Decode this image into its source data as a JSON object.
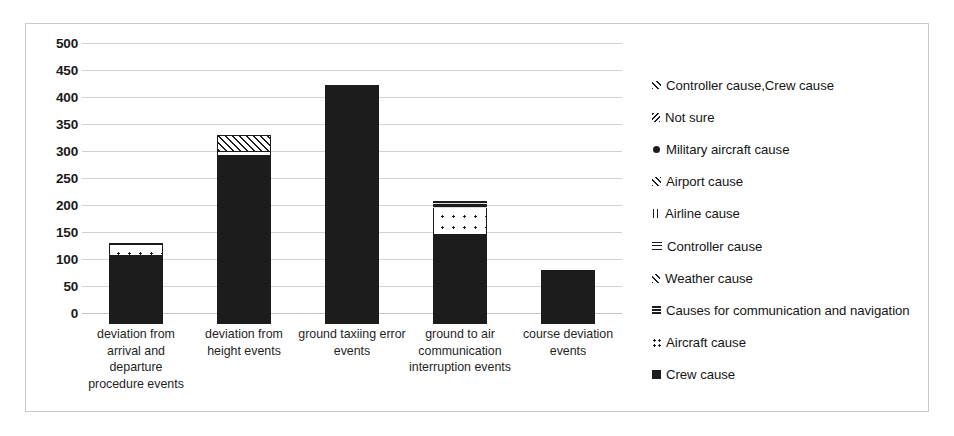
{
  "chart_data": {
    "type": "bar",
    "title": "",
    "xlabel": "",
    "ylabel": "",
    "ylim": [
      0,
      500
    ],
    "ytick_step": 50,
    "grid": true,
    "legend_position": "right",
    "stacked": true,
    "categories": [
      "deviation from arrival and departure procedure events",
      "deviation from height events",
      "ground taxiing error events",
      "ground to air communication interruption events",
      "course deviation events"
    ],
    "ytick_labels": [
      "500",
      "450",
      "400",
      "350",
      "300",
      "250",
      "200",
      "150",
      "100",
      "50",
      "0"
    ],
    "ytick_values": [
      500,
      450,
      400,
      350,
      300,
      250,
      200,
      150,
      100,
      50,
      0
    ],
    "series": [
      {
        "name": "Crew cause",
        "pattern": "solid-black",
        "values": [
          128,
          313,
          438,
          167,
          100
        ]
      },
      {
        "name": "Aircraft  cause",
        "pattern": "dotted",
        "values": [
          18,
          6,
          0,
          48,
          0
        ]
      },
      {
        "name": "Causes for communication and navigation",
        "pattern": "horizontal-lines-dark",
        "values": [
          0,
          0,
          0,
          13,
          0
        ]
      },
      {
        "name": "Weather  cause",
        "pattern": "fine-diagonal",
        "values": [
          0,
          0,
          0,
          0,
          0
        ]
      },
      {
        "name": "Controller cause",
        "pattern": "horizontal-lines",
        "values": [
          0,
          0,
          0,
          0,
          0
        ]
      },
      {
        "name": "Airline  cause",
        "pattern": "vertical-lines",
        "values": [
          0,
          0,
          0,
          0,
          0
        ]
      },
      {
        "name": "Airport  cause",
        "pattern": "diagonal-hatch",
        "values": [
          0,
          31,
          0,
          0,
          0
        ]
      },
      {
        "name": "Military aircraft cause",
        "pattern": "dot-marker",
        "values": [
          0,
          0,
          0,
          0,
          0
        ]
      },
      {
        "name": "Not sure",
        "pattern": "reverse-diagonal",
        "values": [
          0,
          0,
          0,
          0,
          0
        ]
      },
      {
        "name": "Controller cause,Crew cause",
        "pattern": "diagonal-thin",
        "values": [
          4,
          0,
          5,
          0,
          0
        ]
      }
    ],
    "totals": [
      150,
      350,
      443,
      228,
      100
    ]
  },
  "legend": {
    "items": [
      {
        "label": "Controller cause,Crew cause",
        "swatch": "swatch-controller-crew"
      },
      {
        "label": "Not sure",
        "swatch": "swatch-not-sure"
      },
      {
        "label": "Military aircraft cause",
        "swatch": "swatch-military-aircraft"
      },
      {
        "label": "Airport  cause",
        "swatch": "swatch-airport"
      },
      {
        "label": "Airline  cause",
        "swatch": "swatch-airline"
      },
      {
        "label": "Controller cause",
        "swatch": "swatch-controller"
      },
      {
        "label": "Weather  cause",
        "swatch": "swatch-weather"
      },
      {
        "label": "Causes for communication and navigation",
        "swatch": "swatch-communication-navigation"
      },
      {
        "label": "Aircraft  cause",
        "swatch": "swatch-aircraft"
      },
      {
        "label": "Crew cause",
        "swatch": "swatch-crew"
      }
    ]
  },
  "colors": {
    "series_dark": "#1c1c1c",
    "gridline": "#d2d2d2",
    "frame_border": "#c9c9c9",
    "background": "#ffffff",
    "text": "#141414"
  }
}
